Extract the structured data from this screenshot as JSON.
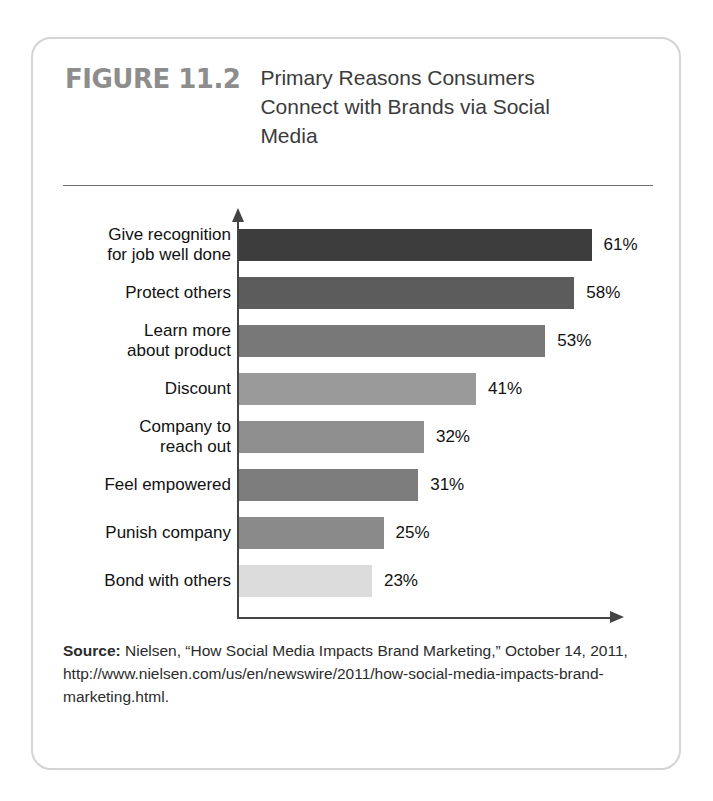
{
  "figure": {
    "number": "FIGURE 11.2",
    "title": "Primary Reasons Consumers Connect with Brands via Social Media"
  },
  "source": {
    "label": "Source:",
    "text": " Nielsen, “How Social Media Impacts Brand Marketing,” October 14, 2011, http://www.nielsen.com/us/en/newswire/2011/how-social-media-impacts-brand-marketing.html."
  },
  "chart_data": {
    "type": "bar",
    "orientation": "horizontal",
    "title": "Primary Reasons Consumers Connect with Brands via Social Media",
    "xlabel": "",
    "ylabel": "",
    "xlim": [
      0,
      70
    ],
    "grid": false,
    "legend": false,
    "value_suffix": "%",
    "categories": [
      "Give recognition\nfor job well done",
      "Protect others",
      "Learn more\nabout product",
      "Discount",
      "Company to\nreach out",
      "Feel empowered",
      "Punish company",
      "Bond with others"
    ],
    "values": [
      61,
      58,
      53,
      41,
      32,
      31,
      25,
      23
    ],
    "value_labels": [
      "61%",
      "58%",
      "53%",
      "41%",
      "32%",
      "31%",
      "25%",
      "23%"
    ],
    "colors": [
      "#3d3d3d",
      "#5c5c5c",
      "#787878",
      "#9a9a9a",
      "#8f8f8f",
      "#7d7d7d",
      "#8a8a8a",
      "#dcdcdc"
    ]
  }
}
